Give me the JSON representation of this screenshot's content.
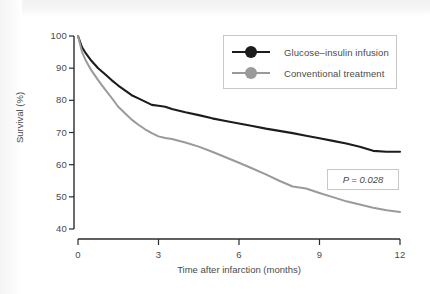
{
  "chart_data": {
    "type": "line",
    "title": "",
    "subtitle": "",
    "xlabel": "Time after infarction (months)",
    "ylabel": "Survival (%)",
    "xlim": [
      0,
      12
    ],
    "ylim": [
      40,
      100
    ],
    "xticks": [
      "0",
      "3",
      "6",
      "9",
      "12"
    ],
    "xtick_values": [
      0,
      3,
      6,
      9,
      12
    ],
    "yticks": [
      "40",
      "50",
      "60",
      "70",
      "80",
      "90",
      "100"
    ],
    "ytick_values": [
      40,
      50,
      60,
      70,
      80,
      90,
      100
    ],
    "grid": false,
    "legend_position": "top-right",
    "x": [
      0,
      0.15,
      0.3,
      0.5,
      0.75,
      1,
      1.25,
      1.5,
      1.75,
      2,
      2.25,
      2.5,
      2.75,
      3,
      3.25,
      3.5,
      4,
      4.5,
      5,
      5.5,
      6,
      6.5,
      7,
      7.5,
      8,
      8.5,
      9,
      9.5,
      10,
      10.5,
      11,
      11.5,
      12
    ],
    "series": [
      {
        "name": "Glucose–insulin infusion",
        "color": "#1c1c1c",
        "values": [
          100,
          96.5,
          94.5,
          92.3,
          90.0,
          88.2,
          86.3,
          84.6,
          83.1,
          81.6,
          80.6,
          79.6,
          78.6,
          78.3,
          78.0,
          77.3,
          76.3,
          75.4,
          74.4,
          73.6,
          72.8,
          72.0,
          71.2,
          70.5,
          69.8,
          69.0,
          68.2,
          67.4,
          66.6,
          65.6,
          64.3,
          64.0,
          64.0
        ]
      },
      {
        "name": "Conventional treatment",
        "color": "#9a9a9a",
        "values": [
          100,
          95.0,
          92.2,
          89.3,
          86.3,
          83.5,
          80.8,
          78.0,
          76.0,
          74.0,
          72.4,
          71.0,
          69.8,
          68.8,
          68.3,
          68.0,
          66.9,
          65.6,
          64.0,
          62.3,
          60.6,
          58.8,
          57.0,
          55.0,
          53.2,
          52.6,
          51.2,
          49.9,
          48.6,
          47.6,
          46.6,
          45.8,
          45.3
        ]
      }
    ],
    "annotations": [
      {
        "name": "p-value",
        "text": "P = 0.028",
        "x": 10.5,
        "y": 56
      }
    ]
  },
  "legend": {
    "items": [
      {
        "label": "Glucose–insulin infusion",
        "color": "#1c1c1c"
      },
      {
        "label": "Conventional treatment",
        "color": "#9a9a9a"
      }
    ]
  },
  "axes": {
    "x": {
      "label": "Time after infarction (months)",
      "ticks": [
        "0",
        "3",
        "6",
        "9",
        "12"
      ]
    },
    "y": {
      "label": "Survival (%)",
      "ticks": [
        "100",
        "90",
        "80",
        "70",
        "60",
        "50",
        "40"
      ]
    }
  },
  "annotation": {
    "p_value": "P = 0.028"
  },
  "colors": {
    "series_black": "#1c1c1c",
    "series_grey": "#9a9a9a",
    "axis": "#2b2b2b",
    "text": "#4a4a4a",
    "box_border": "#c8c8c8",
    "background": "#ffffff"
  }
}
